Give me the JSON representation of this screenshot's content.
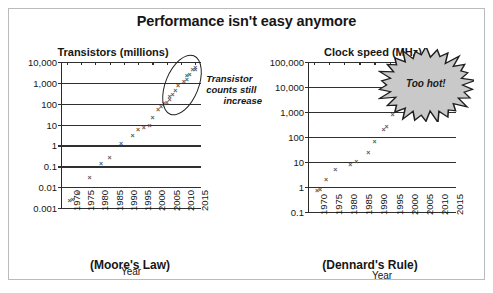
{
  "figure": {
    "title": "Performance isn't easy anymore"
  },
  "chart_data": [
    {
      "type": "scatter",
      "panel": "left",
      "title": "Transistors (millions)",
      "caption": "(Moore's Law)",
      "xlabel": "Year",
      "ylabel": "Transistors (millions)",
      "yscale": "log",
      "ylim": [
        0.001,
        10000
      ],
      "xlim": [
        1968,
        2017
      ],
      "grid": true,
      "legend": "none",
      "ytick_labels": [
        "10,000",
        "1,000",
        "100",
        "10",
        "1",
        "0.1",
        "0.01",
        "0.001"
      ],
      "ytick_values": [
        10000,
        1000,
        100,
        10,
        1,
        0.1,
        0.01,
        0.001
      ],
      "xtick_labels": [
        "1970",
        "1975",
        "1980",
        "1985",
        "1990",
        "1995",
        "2000",
        "2005",
        "2010",
        "2015"
      ],
      "xtick_values": [
        1970,
        1975,
        1980,
        1985,
        1990,
        1995,
        2000,
        2005,
        2010,
        2015
      ],
      "points": [
        {
          "x": 1971,
          "y": 0.0023
        },
        {
          "x": 1972,
          "y": 0.0025
        },
        {
          "x": 1974,
          "y": 0.005
        },
        {
          "x": 1978,
          "y": 0.029
        },
        {
          "x": 1982,
          "y": 0.134
        },
        {
          "x": 1985,
          "y": 0.275
        },
        {
          "x": 1989,
          "y": 1.2
        },
        {
          "x": 1993,
          "y": 3.1
        },
        {
          "x": 1995,
          "y": 5.5
        },
        {
          "x": 1997,
          "y": 7.5
        },
        {
          "x": 1999,
          "y": 9.5
        },
        {
          "x": 2000,
          "y": 21
        },
        {
          "x": 2002,
          "y": 55
        },
        {
          "x": 2003,
          "y": 77
        },
        {
          "x": 2004,
          "y": 106
        },
        {
          "x": 2005,
          "y": 112
        },
        {
          "x": 2006,
          "y": 152
        },
        {
          "x": 2006,
          "y": 230
        },
        {
          "x": 2007,
          "y": 290
        },
        {
          "x": 2008,
          "y": 410
        },
        {
          "x": 2009,
          "y": 731
        },
        {
          "x": 2011,
          "y": 1170
        },
        {
          "x": 2012,
          "y": 1400
        },
        {
          "x": 2012,
          "y": 2300
        },
        {
          "x": 2013,
          "y": 2600
        },
        {
          "x": 2014,
          "y": 4300
        },
        {
          "x": 2015,
          "y": 5500
        },
        {
          "x": 2015,
          "y": 4500
        }
      ],
      "annotations": [
        {
          "name": "transistor-trend-ellipse",
          "kind": "ellipse",
          "text": ""
        },
        {
          "name": "transistor-trend-note",
          "kind": "text",
          "text": "Transistor\ncounts still\nincrease",
          "lines": [
            "Transistor",
            "counts still",
            "increase"
          ]
        }
      ]
    },
    {
      "type": "scatter",
      "panel": "right",
      "title": "Clock speed (MHz)",
      "caption": "(Dennard's Rule)",
      "xlabel": "Year",
      "ylabel": "Clock speed (MHz)",
      "yscale": "log",
      "ylim": [
        0.1,
        100000
      ],
      "xlim": [
        1968,
        2017
      ],
      "grid": true,
      "legend": "none",
      "ytick_labels": [
        "100,000",
        "10,000",
        "1,000",
        "100",
        "10",
        "1",
        "0.1"
      ],
      "ytick_values": [
        100000,
        10000,
        1000,
        100,
        10,
        1,
        0.1
      ],
      "xtick_labels": [
        "1970",
        "1975",
        "1980",
        "1985",
        "1990",
        "1995",
        "2000",
        "2005",
        "2010",
        "2015"
      ],
      "xtick_values": [
        1970,
        1975,
        1980,
        1985,
        1990,
        1995,
        2000,
        2005,
        2010,
        2015
      ],
      "points": [
        {
          "x": 1971,
          "y": 0.74
        },
        {
          "x": 1972,
          "y": 0.8
        },
        {
          "x": 1974,
          "y": 2.0
        },
        {
          "x": 1977,
          "y": 4.8
        },
        {
          "x": 1982,
          "y": 8.0
        },
        {
          "x": 1984,
          "y": 10.5
        },
        {
          "x": 1988,
          "y": 25
        },
        {
          "x": 1990,
          "y": 66
        },
        {
          "x": 1993,
          "y": 200
        },
        {
          "x": 1994,
          "y": 270
        },
        {
          "x": 1996,
          "y": 800
        },
        {
          "x": 1999,
          "y": 2000
        },
        {
          "x": 2002,
          "y": 3000
        },
        {
          "x": 2004,
          "y": 3400
        },
        {
          "x": 2006,
          "y": 3000
        },
        {
          "x": 2008,
          "y": 3200
        },
        {
          "x": 2010,
          "y": 3300
        },
        {
          "x": 2012,
          "y": 3500
        },
        {
          "x": 2014,
          "y": 3900
        },
        {
          "x": 2015,
          "y": 2600
        }
      ],
      "annotations": [
        {
          "name": "too-hot-burst",
          "kind": "starburst",
          "text": "Too hot!"
        }
      ]
    }
  ],
  "colors": {
    "marker": "#55575a",
    "grid": "#2f2f2f",
    "axis": "#2a2a2a",
    "burst_fill": "#c9c9c9",
    "burst_stroke": "#1f1f1f",
    "frame": "#b9bcbe",
    "text": "#161616"
  }
}
